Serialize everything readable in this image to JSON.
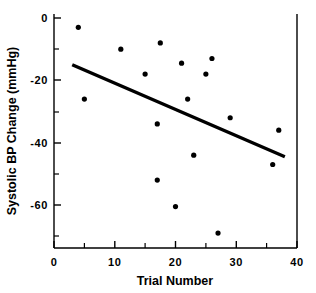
{
  "chart_data": {
    "type": "scatter",
    "title": "",
    "subtitle": "",
    "xlabel": "Trial Number",
    "ylabel": "Systolic BP Change (mmHg)",
    "xlim": [
      0,
      40
    ],
    "ylim": [
      -74,
      0
    ],
    "grid": false,
    "legend": null,
    "x_major_ticks": [
      0,
      10,
      20,
      30,
      40
    ],
    "x_minor_ticks": [
      5,
      15,
      25,
      35
    ],
    "x_tick_labels": [
      "0",
      "10",
      "20",
      "30",
      "40"
    ],
    "y_major_ticks": [
      0,
      -20,
      -40,
      -60
    ],
    "y_minor_ticks": [
      -10,
      -30,
      -50,
      -70
    ],
    "y_tick_labels": [
      "0",
      "-20",
      "-40",
      "-60"
    ],
    "series": [
      {
        "name": "observations",
        "marker": "filled-circle",
        "color": "#000000",
        "points": [
          {
            "x": 4,
            "y": -3
          },
          {
            "x": 5,
            "y": -26
          },
          {
            "x": 11,
            "y": -10
          },
          {
            "x": 15,
            "y": -18
          },
          {
            "x": 17,
            "y": -34
          },
          {
            "x": 17.5,
            "y": -8
          },
          {
            "x": 17,
            "y": -52
          },
          {
            "x": 20,
            "y": -60.5
          },
          {
            "x": 21,
            "y": -14.5
          },
          {
            "x": 22,
            "y": -26
          },
          {
            "x": 23,
            "y": -44
          },
          {
            "x": 25,
            "y": -18
          },
          {
            "x": 26,
            "y": -13
          },
          {
            "x": 27,
            "y": -69
          },
          {
            "x": 29,
            "y": -32
          },
          {
            "x": 36,
            "y": -47
          },
          {
            "x": 37,
            "y": -36
          }
        ]
      }
    ],
    "fit_line": {
      "name": "regression-line",
      "color": "#000000",
      "x_start": 3,
      "y_start": -15,
      "x_end": 38,
      "y_end": -44.5
    }
  },
  "axes": {
    "x_title": "Trial Number",
    "y_title": "Systolic BP Change (mmHg)"
  }
}
